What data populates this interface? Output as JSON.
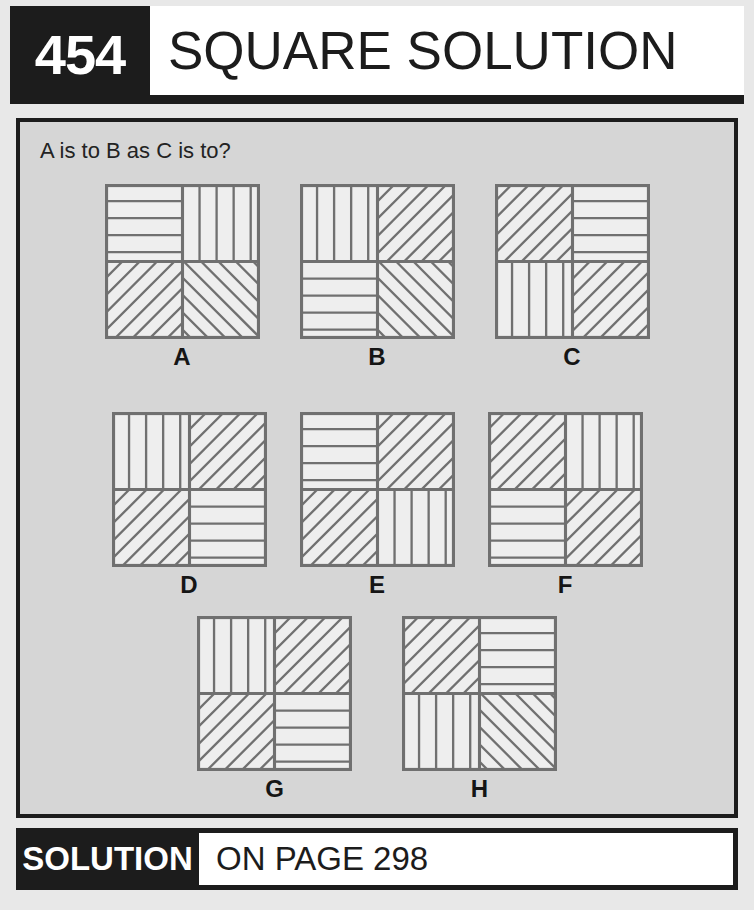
{
  "header": {
    "number": "454",
    "title": "SQUARE SOLUTION"
  },
  "panel": {
    "question": "A is to B as C is to?"
  },
  "footer": {
    "solution_label": "SOLUTION",
    "page_reference": "ON PAGE 298"
  },
  "colors": {
    "ink": "#1c1c1c",
    "panel_background": "#d6d6d6",
    "page_background": "#e8e8e8",
    "tile_fill": "#eeeeee",
    "line": "#707070"
  },
  "puzzle": {
    "type": "visual-analogy",
    "prompt": "A is to B as C is to?",
    "pattern_legend": {
      "H": "horizontal hatching",
      "V": "vertical hatching",
      "U": "diagonal hatching rising to the right",
      "D": "diagonal hatching falling to the right"
    },
    "rows": [
      {
        "name": "premise-row",
        "figures": [
          {
            "label": "A",
            "quadrants": {
              "tl": "H",
              "tr": "V",
              "bl": "U",
              "br": "D"
            }
          },
          {
            "label": "B",
            "quadrants": {
              "tl": "V",
              "tr": "U",
              "bl": "H",
              "br": "D"
            }
          },
          {
            "label": "C",
            "quadrants": {
              "tl": "U",
              "tr": "H",
              "bl": "V",
              "br": "U"
            }
          }
        ]
      },
      {
        "name": "options-row-1",
        "figures": [
          {
            "label": "D",
            "quadrants": {
              "tl": "V",
              "tr": "U",
              "bl": "U",
              "br": "H"
            }
          },
          {
            "label": "E",
            "quadrants": {
              "tl": "H",
              "tr": "U",
              "bl": "U",
              "br": "V"
            }
          },
          {
            "label": "F",
            "quadrants": {
              "tl": "U",
              "tr": "V",
              "bl": "H",
              "br": "U"
            }
          }
        ]
      },
      {
        "name": "options-row-2",
        "figures": [
          {
            "label": "G",
            "quadrants": {
              "tl": "V",
              "tr": "U",
              "bl": "U",
              "br": "H"
            }
          },
          {
            "label": "H",
            "quadrants": {
              "tl": "U",
              "tr": "H",
              "bl": "V",
              "br": "D"
            }
          }
        ]
      }
    ]
  }
}
